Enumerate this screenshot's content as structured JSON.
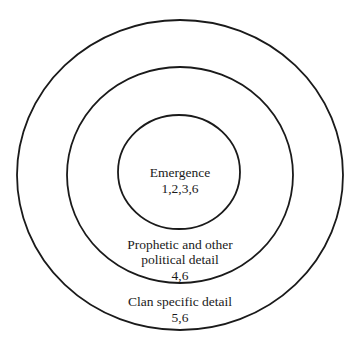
{
  "diagram": {
    "type": "concentric-circles",
    "stroke_color": "#1a1a1a",
    "rings": [
      {
        "id": "inner",
        "title": "Emergence",
        "numbers": "1,2,3,6"
      },
      {
        "id": "middle",
        "title_line1": "Prophetic and other",
        "title_line2": "political detail",
        "numbers": "4,6"
      },
      {
        "id": "outer",
        "title": "Clan specific detail",
        "numbers": "5,6"
      }
    ]
  }
}
